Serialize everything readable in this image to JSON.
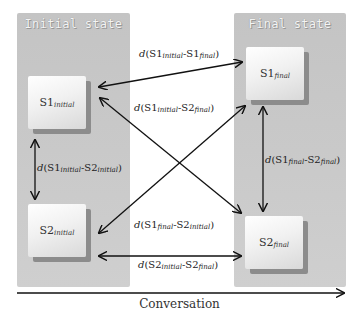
{
  "diagram": {
    "panels": {
      "initial": {
        "title": "Initial state"
      },
      "final": {
        "title": "Final state"
      }
    },
    "states": {
      "s1_initial": {
        "base": "S1",
        "sub": "initial"
      },
      "s2_initial": {
        "base": "S2",
        "sub": "initial"
      },
      "s1_final": {
        "base": "S1",
        "sub": "final"
      },
      "s2_final": {
        "base": "S2",
        "sub": "final"
      }
    },
    "distances": {
      "s1i_s1f": {
        "d": "d",
        "open": "(S1",
        "sub1": "initial",
        "mid": "-S1",
        "sub2": "final",
        "close": ")"
      },
      "s1i_s2f": {
        "d": "d",
        "open": "(S1",
        "sub1": "initial",
        "mid": "-S2",
        "sub2": "final",
        "close": ")"
      },
      "s1i_s2i": {
        "d": "d",
        "open": "(S1",
        "sub1": "initial",
        "mid": "-S2",
        "sub2": "initial",
        "close": ")"
      },
      "s1f_s2f": {
        "d": "d",
        "open": "(S1",
        "sub1": "final",
        "mid": "-S2",
        "sub2": "final",
        "close": ")"
      },
      "s1f_s2i": {
        "d": "d",
        "open": "(S1",
        "sub1": "final",
        "mid": "-S2",
        "sub2": "initial",
        "close": ")"
      },
      "s2i_s2f": {
        "d": "d",
        "open": "(S2",
        "sub1": "initial",
        "mid": "-S2",
        "sub2": "final",
        "close": ")"
      }
    },
    "axis": {
      "label": "Conversation"
    },
    "colors": {
      "panel": "#c9c9c9",
      "box_shadow": "#8c8c8c",
      "arrow": "#111111"
    }
  }
}
